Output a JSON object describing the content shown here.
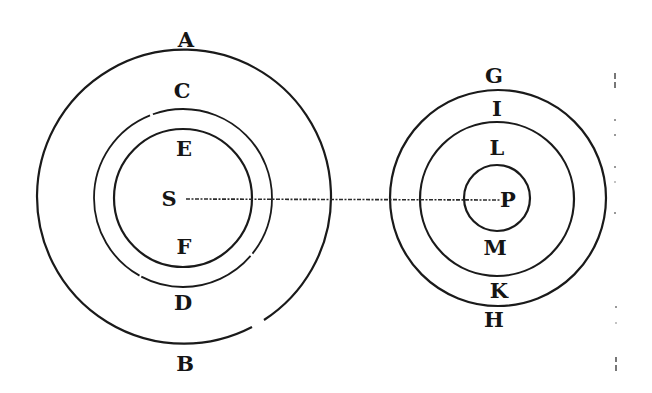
{
  "diagram": {
    "left_system": {
      "center_label": "S",
      "outer_ring": {
        "top_label": "A",
        "bottom_label": "B"
      },
      "middle_ring": {
        "top_label": "C",
        "bottom_label": "D"
      },
      "inner_ring": {
        "top_label": "E",
        "bottom_label": "F"
      }
    },
    "right_system": {
      "center_label": "P",
      "outer_ring": {
        "top_label": "G",
        "bottom_label": "H"
      },
      "middle_ring": {
        "top_label": "I",
        "bottom_label": "K"
      },
      "inner_ring": {
        "top_label": "L",
        "bottom_label": "M"
      }
    },
    "connecting_line": {
      "from": "S",
      "to": "P",
      "style": "dashed"
    }
  }
}
